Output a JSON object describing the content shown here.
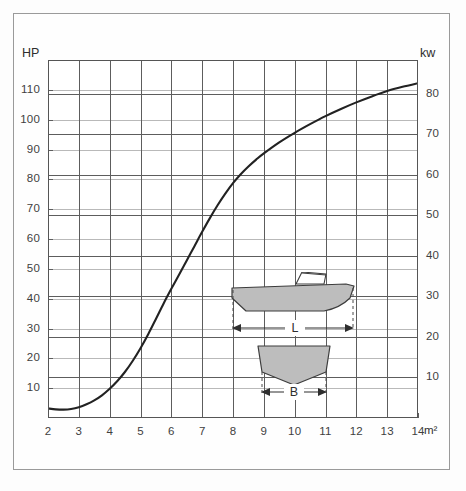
{
  "chart_data": {
    "type": "line",
    "title": "",
    "xlabel": "m²",
    "ylabel": "HP",
    "ylabel_right": "kw",
    "xlim": [
      2,
      14
    ],
    "ylim": [
      0,
      120
    ],
    "ylim_right": [
      0,
      88.3
    ],
    "grid": true,
    "legend": "none",
    "x_unit": "m²",
    "y_unit_left": "HP",
    "y_unit_right": "kw",
    "x_ticks": [
      2,
      3,
      4,
      5,
      6,
      7,
      8,
      9,
      10,
      11,
      12,
      13,
      14
    ],
    "x_tick_labels": [
      "2",
      "3",
      "4",
      "5",
      "6",
      "7",
      "8",
      "9",
      "10",
      "11",
      "12",
      "13",
      "14"
    ],
    "y_ticks_left": [
      10,
      20,
      30,
      40,
      50,
      60,
      70,
      80,
      90,
      100,
      110
    ],
    "y_tick_labels_left": [
      "10",
      "20",
      "30",
      "40",
      "50",
      "60",
      "70",
      "80",
      "90",
      "100",
      "110"
    ],
    "y_ticks_right": [
      10,
      20,
      30,
      40,
      50,
      60,
      70,
      80
    ],
    "y_tick_labels_right": [
      "10",
      "20",
      "30",
      "40",
      "50",
      "60",
      "70",
      "80"
    ],
    "kw_per_hp": 0.7355,
    "x": [
      2.0,
      2.25,
      2.5,
      2.75,
      3.0,
      3.25,
      3.5,
      3.75,
      4.0,
      4.25,
      4.5,
      4.75,
      5.0,
      5.25,
      5.5,
      5.75,
      6.0,
      6.25,
      6.5,
      6.75,
      7.0,
      7.25,
      7.5,
      7.75,
      8.0,
      8.25,
      8.5,
      8.75,
      9.0,
      9.5,
      10.0,
      10.5,
      11.0,
      11.5,
      12.0,
      12.5,
      13.0,
      13.5,
      14.0
    ],
    "values": [
      3.2,
      2.9,
      2.8,
      3.0,
      3.6,
      4.6,
      5.9,
      7.6,
      9.8,
      12.4,
      15.5,
      19.2,
      23.4,
      28.1,
      33.2,
      38.4,
      43.3,
      48.0,
      52.8,
      57.6,
      62.4,
      67.0,
      71.3,
      75.2,
      78.7,
      81.7,
      84.3,
      86.6,
      88.7,
      92.4,
      95.6,
      98.5,
      101.2,
      103.6,
      105.8,
      107.8,
      109.6,
      111.0,
      112.2
    ],
    "series_name": "Recommended engine power"
  },
  "axes": {
    "hp_label": "HP",
    "kw_label": "kw",
    "x_unit_label": "m²"
  },
  "inset": {
    "length_label": "L",
    "beam_label": "B",
    "side_view_name": "boat-side-view",
    "section_view_name": "boat-cross-section",
    "hull_fill": "#bdbdbd",
    "hull_stroke": "#3c3c3c"
  },
  "colors": {
    "curve": "#222222",
    "grid_hp": "#b9b9b9",
    "grid_kw": "#5d5d5d",
    "frame": "#9a9a9a",
    "text": "#3f3f3f",
    "background": "#fdfdfd"
  }
}
